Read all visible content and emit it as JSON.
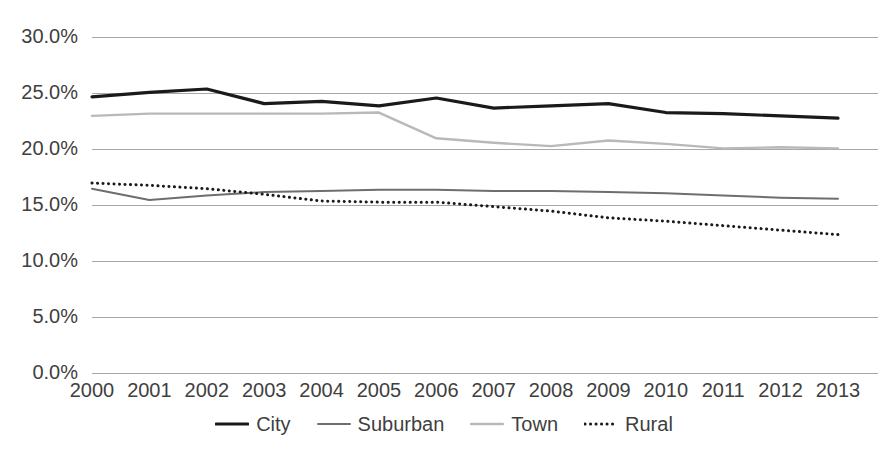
{
  "chart_data": {
    "type": "line",
    "title": "",
    "subtitle": "",
    "xlabel": "",
    "ylabel": "",
    "x": [
      2000,
      2001,
      2002,
      2003,
      2004,
      2005,
      2006,
      2007,
      2008,
      2009,
      2010,
      2011,
      2012,
      2013
    ],
    "categories": [
      "2000",
      "2001",
      "2002",
      "2003",
      "2004",
      "2005",
      "2006",
      "2007",
      "2008",
      "2009",
      "2010",
      "2011",
      "2012",
      "2013"
    ],
    "ylim": [
      0,
      30
    ],
    "yticks": [
      0,
      5,
      10,
      15,
      20,
      25,
      30
    ],
    "ytick_labels": [
      "0.0%",
      "5.0%",
      "10.0%",
      "15.0%",
      "20.0%",
      "25.0%",
      "30.0%"
    ],
    "grid": true,
    "grid_axis": "y",
    "legend_position": "bottom",
    "series": [
      {
        "name": "City",
        "color": "#1a1a1a",
        "width": 3.2,
        "dash": "none",
        "values": [
          24.7,
          25.1,
          25.4,
          24.1,
          24.3,
          23.9,
          24.6,
          23.7,
          23.9,
          24.1,
          23.3,
          23.2,
          23.0,
          22.8
        ]
      },
      {
        "name": "Suburban",
        "color": "#6e6e6e",
        "width": 2.0,
        "dash": "none",
        "values": [
          16.5,
          15.5,
          15.9,
          16.2,
          16.3,
          16.4,
          16.4,
          16.3,
          16.3,
          16.2,
          16.1,
          15.9,
          15.7,
          15.6
        ]
      },
      {
        "name": "Town",
        "color": "#b9b9b9",
        "width": 2.4,
        "dash": "none",
        "values": [
          23.0,
          23.2,
          23.2,
          23.2,
          23.2,
          23.3,
          21.0,
          20.6,
          20.3,
          20.8,
          20.5,
          20.1,
          20.2,
          20.1
        ]
      },
      {
        "name": "Rural",
        "color": "#1a1a1a",
        "width": 3.0,
        "dash": "dotted",
        "values": [
          17.0,
          16.8,
          16.5,
          16.0,
          15.4,
          15.3,
          15.3,
          14.9,
          14.5,
          13.9,
          13.6,
          13.2,
          12.8,
          12.4
        ]
      }
    ]
  }
}
